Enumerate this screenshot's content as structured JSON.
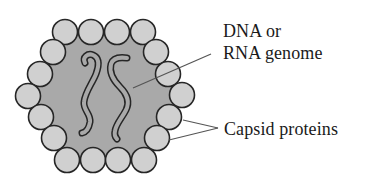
{
  "diagram": {
    "labels": {
      "genome_line1": "DNA or",
      "genome_line2": "RNA genome",
      "capsid": "Capsid proteins"
    },
    "colors": {
      "background": "#ffffff",
      "core_fill": "#a9a9a9",
      "capsomere_fill": "#d0d0d0",
      "outline": "#262626",
      "leader_line": "#555555",
      "text": "#1a1a1a"
    },
    "capsomere_count": 18,
    "genome_strand_count": 2
  }
}
